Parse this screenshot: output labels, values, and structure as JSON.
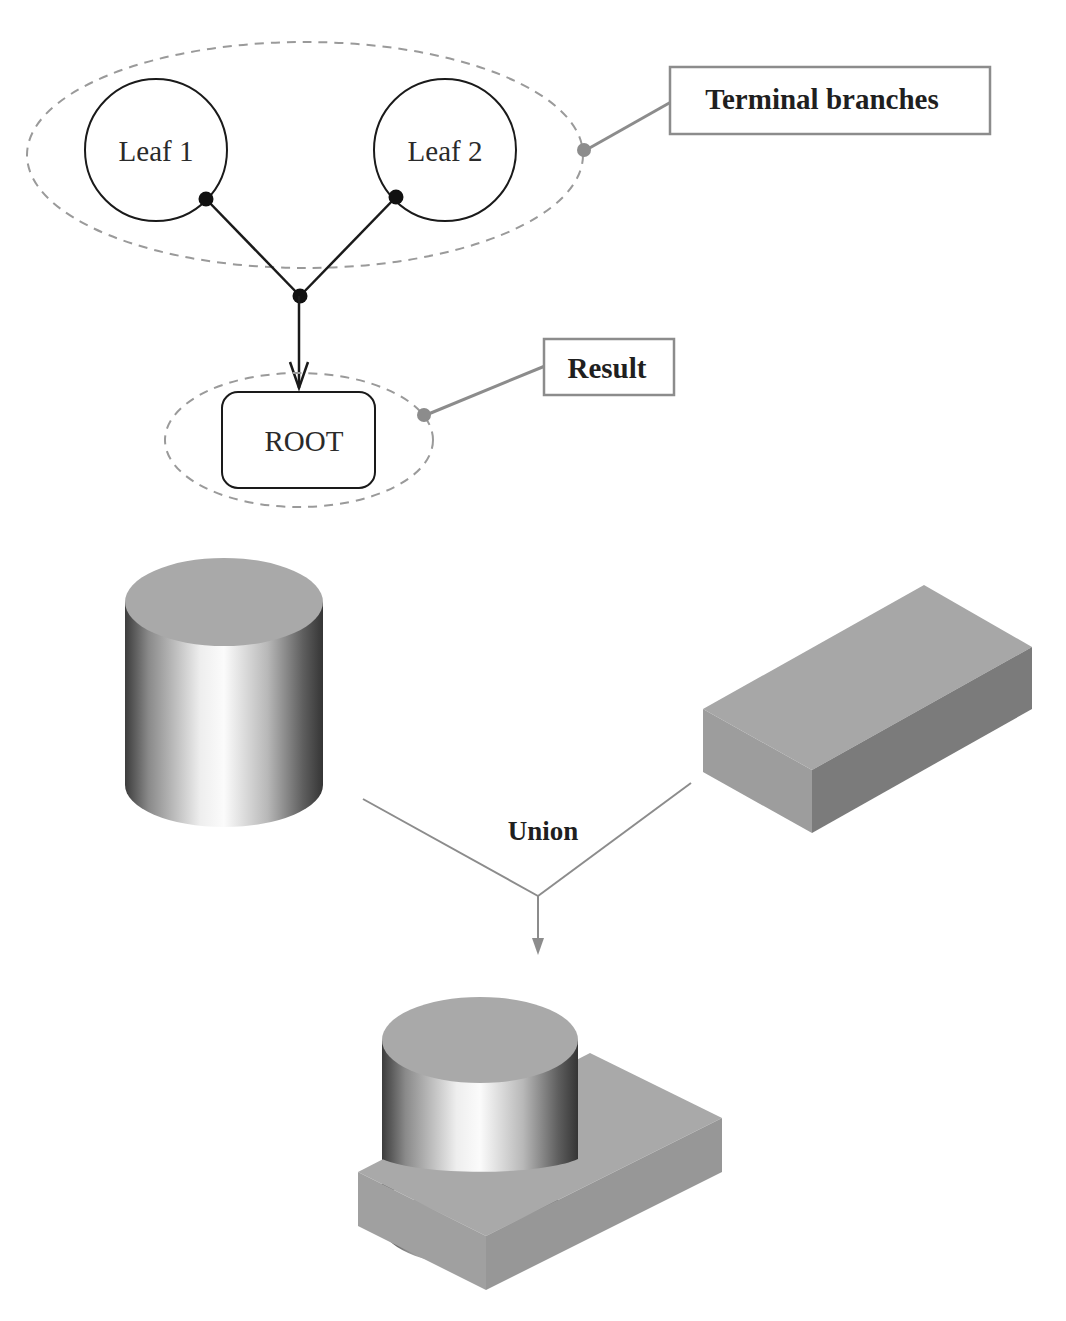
{
  "tree": {
    "leaves": [
      {
        "label": "Leaf 1"
      },
      {
        "label": "Leaf 2"
      }
    ],
    "root": {
      "label": "ROOT"
    }
  },
  "callouts": {
    "terminal": "Terminal branches",
    "result": "Result"
  },
  "csg": {
    "operation": "Union",
    "operands": [
      "cylinder",
      "box"
    ],
    "result": "cylinder-box-union"
  },
  "colors": {
    "line_dark": "#1a1a1a",
    "callout_gray": "#8c8c8c",
    "dashed_gray": "#9a9a9a",
    "solid_top": "#a9a9a9",
    "box_front": "#9b9b9b",
    "box_side": "#7a7a7a"
  }
}
